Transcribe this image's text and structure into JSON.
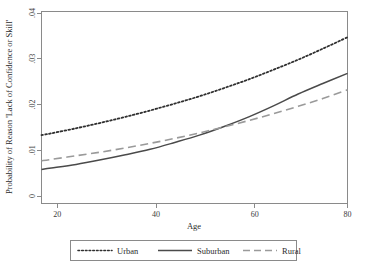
{
  "chart_data": {
    "type": "line",
    "title": "",
    "xlabel": "Age",
    "ylabel": "Probability of Reason 'Lack of Confidence or Skill'",
    "xlim": [
      18,
      80
    ],
    "ylim": [
      0,
      0.04
    ],
    "xticks": [
      "20",
      "40",
      "60",
      "80"
    ],
    "xtick_values": [
      20,
      40,
      60,
      80
    ],
    "yticks": [
      "0",
      ".01",
      ".02",
      ".03",
      ".04"
    ],
    "ytick_values": [
      0,
      0.01,
      0.02,
      0.03,
      0.04
    ],
    "grid": false,
    "legend_position": "bottom",
    "x": [
      18,
      20,
      25,
      30,
      35,
      40,
      45,
      50,
      55,
      60,
      65,
      70,
      75,
      80
    ],
    "series": [
      {
        "name": "Urban",
        "style": "dotted",
        "color": "#2f2f2f",
        "values": [
          0.0133,
          0.0137,
          0.0148,
          0.016,
          0.0173,
          0.0187,
          0.0202,
          0.0218,
          0.0236,
          0.0255,
          0.0276,
          0.0298,
          0.0322,
          0.0347
        ]
      },
      {
        "name": "Suburban",
        "style": "solid",
        "color": "#4a4a4a",
        "values": [
          0.0058,
          0.0061,
          0.0069,
          0.0079,
          0.009,
          0.0102,
          0.0117,
          0.0133,
          0.0152,
          0.0173,
          0.0197,
          0.0223,
          0.0246,
          0.0268
        ]
      },
      {
        "name": "Rural",
        "style": "dashed",
        "color": "#9a9a9a",
        "values": [
          0.0077,
          0.008,
          0.0088,
          0.0096,
          0.0105,
          0.0115,
          0.0126,
          0.0138,
          0.0151,
          0.0165,
          0.018,
          0.0196,
          0.0213,
          0.0232
        ]
      }
    ],
    "annotations": []
  },
  "legend": {
    "items": [
      {
        "label": "Urban"
      },
      {
        "label": "Suburban"
      },
      {
        "label": "Rural"
      }
    ]
  }
}
